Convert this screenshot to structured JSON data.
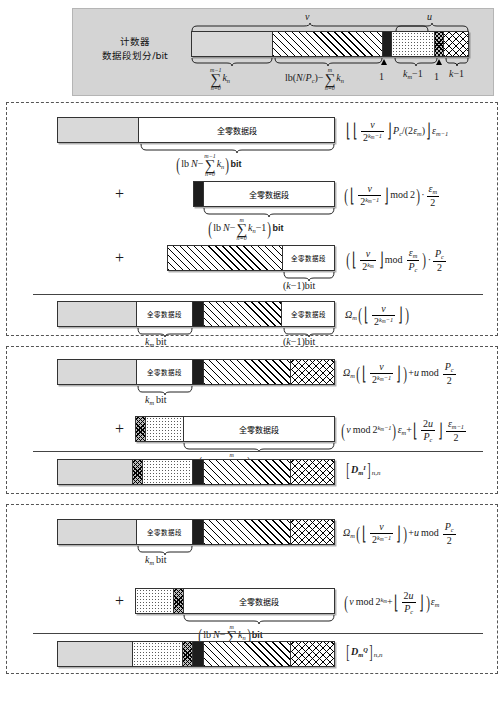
{
  "header": {
    "label_line1": "计数器",
    "label_line2": "数据段划分/bit",
    "top_markers": {
      "v": "v",
      "u": "u"
    },
    "bar_segments": [
      {
        "pattern": "grey",
        "label": ""
      },
      {
        "pattern": "diag",
        "label": ""
      },
      {
        "pattern": "black",
        "label": ""
      },
      {
        "pattern": "dot",
        "label": ""
      },
      {
        "pattern": "crossdense",
        "label": ""
      },
      {
        "pattern": "cross",
        "label": ""
      }
    ],
    "bottom_annotations": [
      {
        "text": "sum_{n=0}^{m-1} k_n",
        "kind": "sum-upper-m-1"
      },
      {
        "text": "lb(N/P_c) - sum_{n=0}^{m} k_n",
        "kind": "lb-minus-sum"
      },
      {
        "text": "1",
        "kind": "one"
      },
      {
        "text": "k_m - 1",
        "kind": "km-minus-1"
      },
      {
        "text": "1",
        "kind": "one"
      },
      {
        "text": "k - 1",
        "kind": "k-minus-1"
      }
    ]
  },
  "zero_segment_label": "全零数据段",
  "plus_sign": "+",
  "block1": {
    "rows": [
      {
        "segments": [
          {
            "pattern": "grey"
          },
          {
            "pattern": "white",
            "label": "全零数据段"
          }
        ],
        "brace_label": "( lb N - sum_{n=0}^{m-1} k_n ) bit",
        "formula_kind": "b1r1"
      },
      {
        "segments": [
          {
            "pattern": "black"
          },
          {
            "pattern": "white",
            "label": "全零数据段"
          }
        ],
        "brace_label": "( lb N - sum_{n=0}^{m} k_n - 1 ) bit",
        "formula_kind": "b1r2"
      },
      {
        "segments": [
          {
            "pattern": "diag"
          },
          {
            "pattern": "white",
            "label": "全零数据段"
          }
        ],
        "brace_label": "(k-1) bit",
        "formula_kind": "b1r3"
      }
    ],
    "result": {
      "segments": [
        {
          "pattern": "grey"
        },
        {
          "pattern": "white",
          "label": "全零数据段"
        },
        {
          "pattern": "black"
        },
        {
          "pattern": "diag"
        },
        {
          "pattern": "white",
          "label": "全零数据段"
        }
      ],
      "brace_left_label": "k_m bit",
      "brace_right_label": "(k-1) bit",
      "formula_kind": "b1res"
    }
  },
  "block2": {
    "rows": [
      {
        "segments": [
          {
            "pattern": "grey"
          },
          {
            "pattern": "white",
            "label": "全零数据段"
          },
          {
            "pattern": "black"
          },
          {
            "pattern": "diag"
          },
          {
            "pattern": "cross"
          }
        ],
        "brace_label": "k_m bit",
        "formula_kind": "b2r1"
      },
      {
        "segments": [
          {
            "pattern": "crossdense"
          },
          {
            "pattern": "dot"
          },
          {
            "pattern": "white",
            "label": "全零数据段"
          }
        ],
        "brace_label": "( lb N - sum_{n=0}^{m} k_n ) bit",
        "formula_kind": "b2r2"
      }
    ],
    "result": {
      "segments": [
        {
          "pattern": "grey"
        },
        {
          "pattern": "crossdense"
        },
        {
          "pattern": "dot"
        },
        {
          "pattern": "black"
        },
        {
          "pattern": "diag"
        },
        {
          "pattern": "cross"
        }
      ],
      "formula_kind": "b2res"
    }
  },
  "block3": {
    "rows": [
      {
        "segments": [
          {
            "pattern": "grey"
          },
          {
            "pattern": "white",
            "label": "全零数据段"
          },
          {
            "pattern": "black"
          },
          {
            "pattern": "diag"
          },
          {
            "pattern": "cross"
          }
        ],
        "brace_label": "k_m bit",
        "formula_kind": "b3r1"
      },
      {
        "segments": [
          {
            "pattern": "dot"
          },
          {
            "pattern": "crossdense"
          },
          {
            "pattern": "white",
            "label": "全零数据段"
          }
        ],
        "brace_label": "( lb N - sum_{n=0}^{m} k_n ) bit",
        "formula_kind": "b3r2"
      }
    ],
    "result": {
      "segments": [
        {
          "pattern": "grey"
        },
        {
          "pattern": "dot"
        },
        {
          "pattern": "crossdense"
        },
        {
          "pattern": "black"
        },
        {
          "pattern": "diag"
        },
        {
          "pattern": "cross"
        }
      ],
      "formula_kind": "b3res"
    }
  },
  "labels": {
    "km_bit": "k_m bit",
    "k_minus_1_bit": "(k-1)bit",
    "bit": "bit",
    "mod": "mod",
    "lb": "lb"
  }
}
